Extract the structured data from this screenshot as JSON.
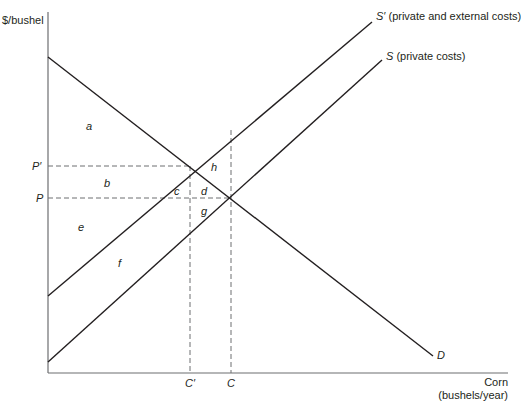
{
  "axes": {
    "y_label": "$/bushel",
    "x_label_line1": "Corn",
    "x_label_line2": "(bushels/year)"
  },
  "curves": {
    "s_prime": {
      "symbol": "S′",
      "desc": "(private and external costs)"
    },
    "s": {
      "symbol": "S",
      "desc": "(private costs)"
    },
    "d": {
      "symbol": "D"
    }
  },
  "ticks": {
    "p_prime": "P′",
    "p": "P",
    "c_prime": "C′",
    "c": "C"
  },
  "regions": {
    "a": "a",
    "b": "b",
    "c": "c",
    "d": "d",
    "e": "e",
    "f": "f",
    "g": "g",
    "h": "h"
  },
  "colors": {
    "line": "#231f20",
    "dashed": "#6d6e71",
    "axis": "#6d6e71"
  }
}
